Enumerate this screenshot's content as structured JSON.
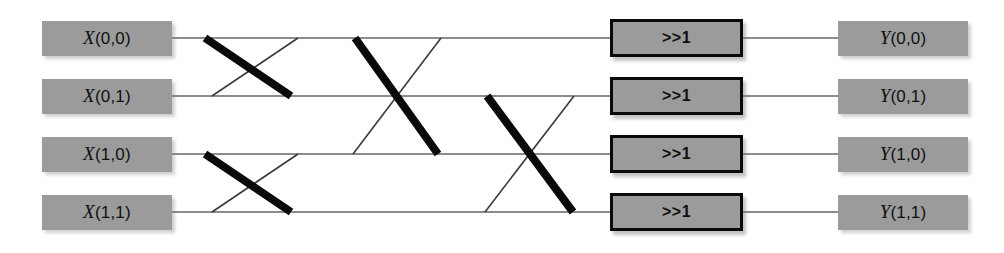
{
  "diagram": {
    "canvas": {
      "width": 1004,
      "height": 253,
      "background": "#ffffff"
    },
    "colors": {
      "box_fill": "#9b9b9b",
      "box_border": "#0a0a0a",
      "wire": "#8c8c8c",
      "thin_cross": "#3a3a3a",
      "thick_cross": "#0a0a0a",
      "text": "#101010"
    },
    "inputs": [
      {
        "name": "X(0,0)",
        "var": "X",
        "index": "(0,0)",
        "row": 0,
        "y": 38
      },
      {
        "name": "X(0,1)",
        "var": "X",
        "index": "(0,1)",
        "row": 1,
        "y": 96
      },
      {
        "name": "X(1,0)",
        "var": "X",
        "index": "(1,0)",
        "row": 2,
        "y": 154
      },
      {
        "name": "X(1,1)",
        "var": "X",
        "index": "(1,1)",
        "row": 3,
        "y": 212
      }
    ],
    "operators": [
      {
        "name": ">>1",
        "row": 0,
        "y": 38
      },
      {
        "name": ">>1",
        "row": 1,
        "y": 96
      },
      {
        "name": ">>1",
        "row": 2,
        "y": 154
      },
      {
        "name": ">>1",
        "row": 3,
        "y": 212
      }
    ],
    "outputs": [
      {
        "name": "Y(0,0)",
        "var": "Y",
        "index": "(0,0)",
        "row": 0,
        "y": 38
      },
      {
        "name": "Y(0,1)",
        "var": "Y",
        "index": "(0,1)",
        "row": 1,
        "y": 96
      },
      {
        "name": "Y(1,0)",
        "var": "Y",
        "index": "(1,0)",
        "row": 2,
        "y": 154
      },
      {
        "name": "Y(1,1)",
        "var": "Y",
        "index": "(1,1)",
        "row": 3,
        "y": 212
      }
    ],
    "geometry": {
      "row_y": [
        38,
        96,
        154,
        212
      ],
      "input_box": {
        "x": 42,
        "width": 130,
        "height": 35
      },
      "op_box": {
        "x": 610,
        "width": 133,
        "height": 38
      },
      "output_box": {
        "x": 838,
        "width": 130,
        "height": 35
      },
      "rail_start": 172,
      "rail_end": 610,
      "out_rail_start": 743,
      "out_rail_end": 838
    },
    "crossings": [
      {
        "stage": 1,
        "pair": "row0-row1",
        "thick": {
          "x1": 205,
          "y1": 38,
          "x2": 291,
          "y2": 96
        },
        "thin": {
          "x1": 212,
          "y1": 96,
          "x2": 298,
          "y2": 38
        }
      },
      {
        "stage": 1,
        "pair": "row2-row3",
        "thick": {
          "x1": 205,
          "y1": 154,
          "x2": 291,
          "y2": 212
        },
        "thin": {
          "x1": 212,
          "y1": 212,
          "x2": 298,
          "y2": 154
        }
      },
      {
        "stage": 2,
        "pair": "row0-row2",
        "thick": {
          "x1": 355,
          "y1": 38,
          "x2": 438,
          "y2": 154
        },
        "thin": {
          "x1": 353,
          "y1": 154,
          "x2": 441,
          "y2": 38
        }
      },
      {
        "stage": 3,
        "pair": "row1-row3",
        "thick": {
          "x1": 487,
          "y1": 96,
          "x2": 573,
          "y2": 212
        },
        "thin": {
          "x1": 485,
          "y1": 212,
          "x2": 574,
          "y2": 96
        }
      }
    ]
  }
}
